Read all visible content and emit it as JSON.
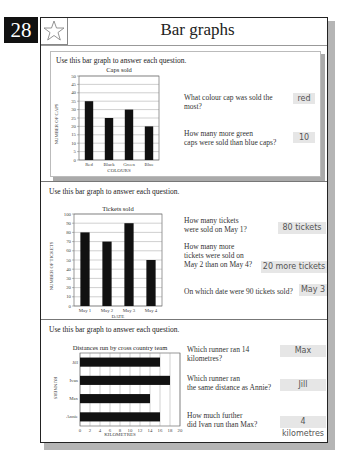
{
  "page": {
    "number": "28",
    "title": "Bar graphs",
    "header_icon": "star-icon"
  },
  "sections": [
    {
      "instruction": "Use this bar graph to answer each question.",
      "questions": [
        {
          "text_line1": "What colour cap was sold the",
          "text_line2": "most?",
          "answer": "red"
        },
        {
          "text_line1": "How many more green",
          "text_line2": "caps were sold than blue caps?",
          "answer": "10"
        }
      ]
    },
    {
      "instruction": "Use this bar graph to answer each question.",
      "questions": [
        {
          "text_line1": "How many tickets",
          "text_line2": "were sold on May 1?",
          "answer": "80 tickets"
        },
        {
          "text_line1": "How many more",
          "text_line2": "tickets were sold on",
          "text_line3": "May 2 than on May 4?",
          "answer": "20 more tickets"
        },
        {
          "text_line1": "On which date were 90 tickets sold?",
          "answer": "May 3"
        }
      ]
    },
    {
      "instruction": "Use this bar graph to answer each question.",
      "questions": [
        {
          "text_line1": "Which runner ran 14",
          "text_line2": "kilometres?",
          "answer": "Max"
        },
        {
          "text_line1": "Which runner ran",
          "text_line2": "the same distance as Annie?",
          "answer": "Jill"
        },
        {
          "text_line1": "How much further",
          "text_line2": "did Ivan run than Max?",
          "answer": "4 kilometres"
        }
      ]
    }
  ],
  "chart_data": [
    {
      "type": "bar",
      "title": "Caps sold",
      "categories": [
        "Red",
        "Black",
        "Green",
        "Blue"
      ],
      "values": [
        35,
        25,
        30,
        20
      ],
      "xlabel": "COLOURS",
      "ylabel": "NUMBER OF CAPS",
      "ylim": [
        0,
        50
      ],
      "yticks": [
        "0",
        "5",
        "10",
        "15",
        "20",
        "25",
        "30",
        "35",
        "40",
        "45",
        "50"
      ],
      "grid": true
    },
    {
      "type": "bar",
      "title": "Tickets sold",
      "categories": [
        "May 1",
        "May 2",
        "May 3",
        "May 4"
      ],
      "values": [
        80,
        70,
        90,
        50
      ],
      "xlabel": "DATE",
      "ylabel": "NUMBER OF TICKETS",
      "ylim": [
        0,
        100
      ],
      "yticks": [
        "0",
        "10",
        "20",
        "30",
        "40",
        "50",
        "60",
        "70",
        "80",
        "90",
        "100"
      ],
      "grid": true
    },
    {
      "type": "bar",
      "orientation": "horizontal",
      "title": "Distances run by cross country team",
      "categories": [
        "Jill",
        "Ivan",
        "Max",
        "Annie"
      ],
      "values": [
        16,
        18,
        14,
        16
      ],
      "xlabel": "KILOMETRES",
      "ylabel": "RUNNERS",
      "xlim": [
        0,
        20
      ],
      "xticks": [
        "0",
        "2",
        "4",
        "6",
        "8",
        "10",
        "12",
        "14",
        "16",
        "18",
        "20"
      ],
      "grid": true
    }
  ]
}
